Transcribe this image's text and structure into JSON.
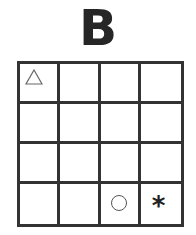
{
  "title": "B",
  "grid": {
    "rows": 4,
    "cols": 4,
    "cells": [
      [
        "triangle",
        "",
        "",
        ""
      ],
      [
        "",
        "",
        "",
        ""
      ],
      [
        "",
        "",
        "",
        ""
      ],
      [
        "",
        "",
        "circle",
        "asterisk"
      ]
    ]
  },
  "symbols": {
    "triangle": {
      "row": 0,
      "col": 0,
      "glyph": "triangle-outline"
    },
    "circle": {
      "row": 3,
      "col": 2,
      "glyph": "circle-outline"
    },
    "asterisk": {
      "row": 3,
      "col": 3,
      "glyph": "*"
    }
  }
}
